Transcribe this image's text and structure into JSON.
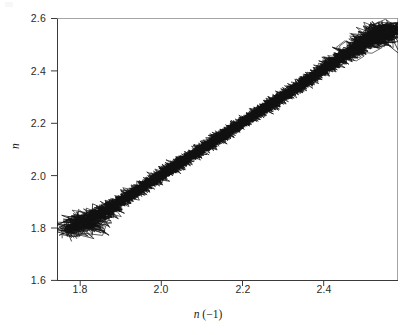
{
  "figure": {
    "background_color": "#ffffff",
    "axis_color": "#3a3a3a",
    "data_color": "#111111"
  },
  "axes": {
    "x_title_var": "n",
    "x_title_suffix": " (−1)",
    "y_title": "n",
    "x_ticks": [
      "1.8",
      "2.0",
      "2.2",
      "2.4"
    ],
    "y_ticks": [
      "2.6",
      "2.4",
      "2.2",
      "2.0",
      "1.8",
      "1.6"
    ]
  },
  "chart_data": {
    "type": "line",
    "title": "",
    "xlabel": "n (−1)",
    "ylabel": "n",
    "xlim": [
      1.745,
      2.585
    ],
    "ylim": [
      1.6,
      2.6
    ],
    "xticks": [
      1.8,
      2.0,
      2.2,
      2.4
    ],
    "yticks": [
      1.6,
      1.8,
      2.0,
      2.2,
      2.4,
      2.6
    ],
    "grid": false,
    "legend": null,
    "series": [
      {
        "name": "return-map-trajectory",
        "marker": "none",
        "connected": true,
        "x": [
          1.782,
          1.775,
          1.8,
          1.832,
          1.812,
          1.79,
          1.822,
          1.845,
          1.838,
          1.86,
          1.852,
          1.872,
          1.865,
          1.885,
          1.878,
          1.895,
          1.888,
          1.905,
          1.898,
          1.915,
          1.908,
          1.925,
          1.918,
          1.935,
          1.928,
          1.945,
          1.938,
          1.952,
          1.944,
          1.96,
          1.955,
          1.97,
          1.962,
          1.978,
          1.971,
          1.986,
          1.979,
          1.994,
          1.988,
          2.002,
          1.996,
          2.01,
          2.004,
          2.018,
          2.012,
          2.026,
          2.02,
          2.034,
          2.028,
          2.042,
          2.036,
          2.05,
          2.044,
          2.058,
          2.052,
          2.066,
          2.06,
          2.074,
          2.068,
          2.082,
          2.076,
          2.09,
          2.084,
          2.098,
          2.092,
          2.106,
          2.1,
          2.114,
          2.108,
          2.122,
          2.116,
          2.13,
          2.124,
          2.138,
          2.132,
          2.146,
          2.14,
          2.154,
          2.148,
          2.162,
          2.156,
          2.17,
          2.164,
          2.178,
          2.172,
          2.186,
          2.18,
          2.194,
          2.188,
          2.202,
          2.196,
          2.21,
          2.204,
          2.218,
          2.212,
          2.226,
          2.22,
          2.234,
          2.228,
          2.242,
          2.236,
          2.25,
          2.244,
          2.258,
          2.252,
          2.266,
          2.26,
          2.274,
          2.268,
          2.282,
          2.276,
          2.29,
          2.284,
          2.298,
          2.292,
          2.306,
          2.3,
          2.314,
          2.308,
          2.322,
          2.316,
          2.33,
          2.324,
          2.338,
          2.332,
          2.346,
          2.34,
          2.354,
          2.348,
          2.362,
          2.356,
          2.37,
          2.364,
          2.38,
          2.372,
          2.392,
          2.384,
          2.404,
          2.396,
          2.418,
          2.408,
          2.432,
          2.42,
          2.446,
          2.436,
          2.462,
          2.452,
          2.478,
          2.468,
          2.492,
          2.482,
          2.506,
          2.496,
          2.52,
          2.51,
          2.534,
          2.524,
          2.548,
          2.54,
          2.56,
          2.552,
          2.566,
          2.558,
          2.548,
          2.53,
          2.512
        ],
        "y": [
          1.78,
          1.796,
          1.812,
          1.804,
          1.826,
          1.818,
          1.84,
          1.832,
          1.854,
          1.846,
          1.866,
          1.858,
          1.878,
          1.87,
          1.89,
          1.882,
          1.9,
          1.892,
          1.91,
          1.902,
          1.92,
          1.912,
          1.93,
          1.922,
          1.94,
          1.932,
          1.948,
          1.94,
          1.956,
          1.948,
          1.966,
          1.958,
          1.974,
          1.966,
          1.982,
          1.974,
          1.99,
          1.982,
          1.998,
          1.99,
          2.006,
          1.998,
          2.014,
          2.006,
          2.022,
          2.014,
          2.03,
          2.022,
          2.038,
          2.03,
          2.046,
          2.038,
          2.054,
          2.046,
          2.062,
          2.054,
          2.07,
          2.062,
          2.078,
          2.07,
          2.086,
          2.078,
          2.094,
          2.086,
          2.102,
          2.094,
          2.11,
          2.102,
          2.118,
          2.11,
          2.126,
          2.118,
          2.134,
          2.126,
          2.142,
          2.134,
          2.15,
          2.142,
          2.158,
          2.15,
          2.166,
          2.158,
          2.174,
          2.166,
          2.182,
          2.174,
          2.19,
          2.182,
          2.198,
          2.19,
          2.206,
          2.198,
          2.214,
          2.206,
          2.222,
          2.214,
          2.23,
          2.222,
          2.238,
          2.23,
          2.246,
          2.238,
          2.254,
          2.246,
          2.262,
          2.254,
          2.27,
          2.262,
          2.278,
          2.27,
          2.286,
          2.278,
          2.294,
          2.286,
          2.302,
          2.294,
          2.31,
          2.302,
          2.318,
          2.31,
          2.326,
          2.318,
          2.334,
          2.326,
          2.342,
          2.334,
          2.35,
          2.342,
          2.358,
          2.35,
          2.366,
          2.358,
          2.376,
          2.368,
          2.388,
          2.38,
          2.4,
          2.392,
          2.414,
          2.404,
          2.428,
          2.416,
          2.442,
          2.432,
          2.458,
          2.448,
          2.474,
          2.464,
          2.488,
          2.478,
          2.502,
          2.492,
          2.516,
          2.506,
          2.53,
          2.52,
          2.544,
          2.536,
          2.556,
          2.548,
          2.562,
          2.554,
          2.544,
          2.526,
          2.508,
          2.53
        ]
      }
    ]
  }
}
